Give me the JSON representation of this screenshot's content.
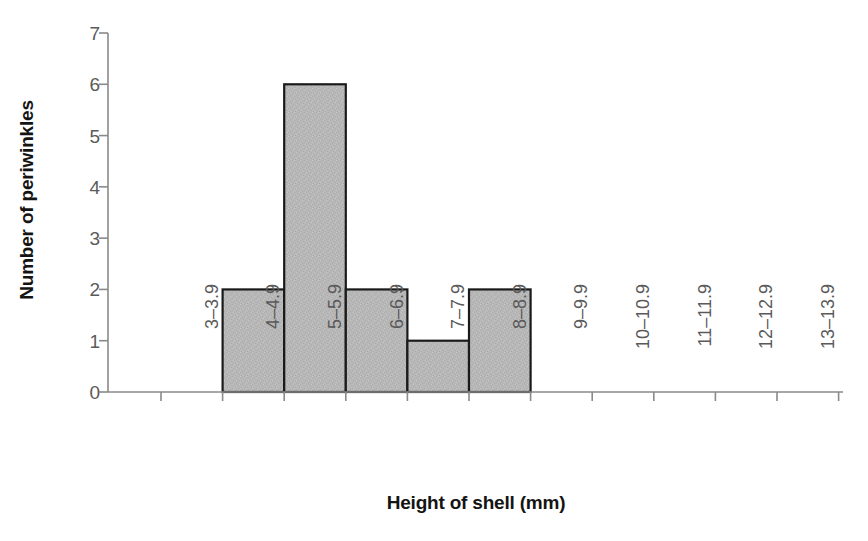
{
  "chart_data": {
    "type": "bar",
    "title": "",
    "subtitle": "",
    "xlabel": "Height of shell (mm)",
    "ylabel": "Number of periwinkles",
    "categories": [
      "3–3.9",
      "4–4.9",
      "5–5.9",
      "6–6.9",
      "7–7.9",
      "8–8.9",
      "9–9.9",
      "10–10.9",
      "11–11.9",
      "12–12.9",
      "13–13.9"
    ],
    "values": [
      0,
      2,
      6,
      2,
      1,
      2,
      0,
      0,
      0,
      0,
      0
    ],
    "ylim": [
      0,
      7
    ],
    "ytick_labels": [
      "0",
      "1",
      "2",
      "3",
      "4",
      "5",
      "6",
      "7"
    ],
    "ytick_values": [
      0,
      1,
      2,
      3,
      4,
      5,
      6,
      7
    ],
    "grid": false,
    "legend": null,
    "legend_position": "none",
    "bar_gap": 0,
    "annotations": []
  },
  "style": {
    "bar_fill": "#b8b8b8",
    "bar_stroke": "#1a1a1a",
    "axis_line": "#8a8a8a",
    "tick_label_color": "#5a5a5a",
    "axis_title_color": "#141414",
    "background": "#ffffff"
  }
}
